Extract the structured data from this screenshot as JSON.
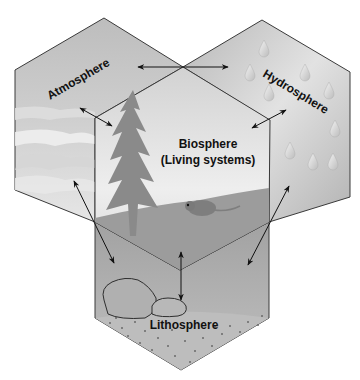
{
  "diagram": {
    "spheres": {
      "atmosphere": {
        "label": "Atmosphere"
      },
      "hydrosphere": {
        "label": "Hydrosphere"
      },
      "biosphere": {
        "label_line1": "Biosphere",
        "label_line2": "(Living systems)"
      },
      "lithosphere": {
        "label": "Lithosphere"
      }
    },
    "interactions": [
      "atmosphere-hydrosphere",
      "atmosphere-biosphere",
      "hydrosphere-biosphere",
      "atmosphere-lithosphere",
      "hydrosphere-lithosphere",
      "biosphere-lithosphere"
    ],
    "colors": {
      "atmosphere": "#c9c9c9",
      "hydrosphere": "#c4c4c4",
      "biosphere": "#dcdcdc",
      "lithosphere": "#ababab",
      "ground": "#9a9a9a",
      "tree": "#8c8c8c",
      "outline": "#3a3a3a"
    }
  }
}
